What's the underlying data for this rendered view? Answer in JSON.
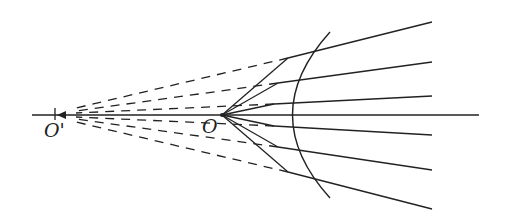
{
  "diagram": {
    "type": "optics-ray-diagram",
    "labels": {
      "O": "O",
      "O_prime": "O'"
    },
    "colors": {
      "line": "#222222",
      "background": "#ffffff"
    },
    "points": {
      "O": [
        222,
        115
      ],
      "O_prime": [
        55,
        115
      ]
    },
    "axis": {
      "x1": 32,
      "x2": 479,
      "y": 115
    },
    "surface_arc": {
      "top": [
        330,
        32
      ],
      "apex": [
        273,
        115
      ],
      "bottom": [
        330,
        198
      ]
    },
    "rays": [
      {
        "hit": [
          288,
          58
        ],
        "end": [
          432,
          22
        ]
      },
      {
        "hit": [
          278,
          83
        ],
        "end": [
          432,
          62
        ]
      },
      {
        "hit": [
          274,
          104
        ],
        "end": [
          432,
          96
        ]
      },
      {
        "hit": [
          274,
          126
        ],
        "end": [
          432,
          135
        ]
      },
      {
        "hit": [
          278,
          147
        ],
        "end": [
          432,
          170
        ]
      },
      {
        "hit": [
          288,
          172
        ],
        "end": [
          432,
          209
        ]
      }
    ]
  }
}
